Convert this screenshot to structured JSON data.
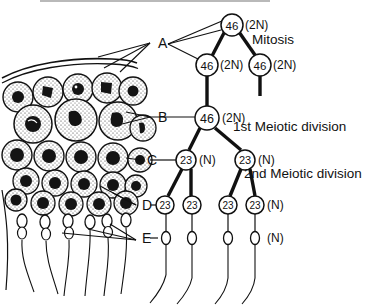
{
  "diagram": {
    "stages": [
      {
        "id": "mitosis",
        "label": "Mitosis",
        "x": 252,
        "y": 40
      },
      {
        "id": "meiosis1",
        "label": "1st Meiotic division",
        "x": 233,
        "y": 127
      },
      {
        "id": "meiosis2",
        "label": "2nd Meiotic division",
        "x": 244,
        "y": 174
      }
    ],
    "key_labels": [
      {
        "id": "A",
        "label": "A",
        "x": 158,
        "y": 43
      },
      {
        "id": "B",
        "label": "B",
        "x": 158,
        "y": 117
      },
      {
        "id": "C",
        "label": "C",
        "x": 147,
        "y": 160
      },
      {
        "id": "D",
        "label": "D",
        "x": 142,
        "y": 205
      },
      {
        "id": "E",
        "label": "E",
        "x": 142,
        "y": 240
      }
    ],
    "cells": [
      {
        "id": "spermatogonium-stem",
        "count": "46",
        "ploidy": "(2N)",
        "cx": 232,
        "cy": 25,
        "r": 11,
        "ploidy_x": 245,
        "ploidy_y": 25
      },
      {
        "id": "spermatogonium-left",
        "count": "46",
        "ploidy": "(2N)",
        "cx": 207,
        "cy": 65,
        "r": 11,
        "ploidy_x": 220,
        "ploidy_y": 65
      },
      {
        "id": "spermatogonium-right",
        "count": "46",
        "ploidy": "(2N)",
        "cx": 260,
        "cy": 65,
        "r": 11,
        "ploidy_x": 273,
        "ploidy_y": 65
      },
      {
        "id": "primary-spermatocyte",
        "count": "46",
        "ploidy": "(2N)",
        "cx": 207,
        "cy": 118,
        "r": 12,
        "ploidy_x": 221,
        "ploidy_y": 118
      },
      {
        "id": "secondary-spermatocyte-left",
        "count": "23",
        "ploidy": "(N)",
        "cx": 186,
        "cy": 160,
        "r": 10,
        "ploidy_x": 199,
        "ploidy_y": 160
      },
      {
        "id": "secondary-spermatocyte-right",
        "count": "23",
        "ploidy": "(N)",
        "cx": 245,
        "cy": 160,
        "r": 10,
        "ploidy_x": 258,
        "ploidy_y": 160
      },
      {
        "id": "spermatid-1",
        "count": "23",
        "ploidy": "",
        "cx": 165,
        "cy": 205,
        "r": 9,
        "ploidy_x": 0,
        "ploidy_y": 0
      },
      {
        "id": "spermatid-2",
        "count": "23",
        "ploidy": "",
        "cx": 192,
        "cy": 205,
        "r": 9,
        "ploidy_x": 0,
        "ploidy_y": 0
      },
      {
        "id": "spermatid-3",
        "count": "23",
        "ploidy": "",
        "cx": 228,
        "cy": 205,
        "r": 9,
        "ploidy_x": 0,
        "ploidy_y": 0
      },
      {
        "id": "spermatid-4",
        "count": "23",
        "ploidy": "(N)",
        "cx": 255,
        "cy": 205,
        "r": 9,
        "ploidy_x": 267,
        "ploidy_y": 205
      }
    ],
    "sperm": [
      {
        "id": "sperm-1",
        "cx": 165,
        "cy": 238
      },
      {
        "id": "sperm-2",
        "cx": 192,
        "cy": 238
      },
      {
        "id": "sperm-3",
        "cx": 228,
        "cy": 238
      },
      {
        "id": "sperm-4",
        "cx": 255,
        "cy": 238
      }
    ],
    "sperm_ploidy": {
      "label": "(N)",
      "x": 267,
      "y": 238
    },
    "colors": {
      "ink": "#111111",
      "background": "#ffffff",
      "rule": "#b9b9b9"
    }
  }
}
